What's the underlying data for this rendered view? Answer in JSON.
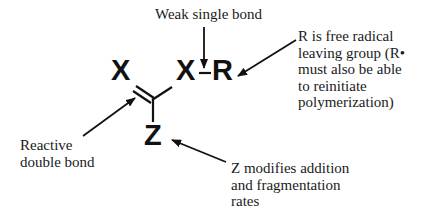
{
  "diagram": {
    "molecule": {
      "atom_x_left": "X",
      "atom_x_right": "X",
      "atom_r": "R",
      "atom_z": "Z"
    },
    "labels": {
      "weak_single_bond": "Weak single bond",
      "reactive_double_bond": [
        "Reactive",
        "double bond"
      ],
      "r_group": [
        "R is free radical",
        "leaving group (R•",
        "must also be able",
        "to reinitiate",
        "polymerization)"
      ],
      "z_group": [
        "Z modifies addition",
        "and fragmentation",
        "rates"
      ]
    },
    "colors": {
      "ink": "#111111",
      "background": "#ffffff"
    }
  }
}
